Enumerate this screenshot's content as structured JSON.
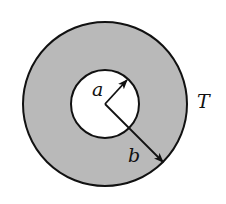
{
  "diagram": {
    "title": "",
    "colors": {
      "background": "#ffffff",
      "annulus_fill": "#b9b9b9",
      "inner_fill": "#ffffff",
      "stroke": "#111111"
    },
    "outer_circle": {
      "cx": 105,
      "cy": 104,
      "r": 82
    },
    "inner_circle": {
      "cx": 105,
      "cy": 104,
      "r": 34
    },
    "labels": {
      "inner_radius": "a",
      "outer_radius": "b",
      "temperature": "T"
    },
    "arrows": [
      {
        "name": "inner-radius-arrow",
        "label": "a",
        "from": [
          105,
          104
        ],
        "to": [
          127,
          80
        ]
      },
      {
        "name": "outer-radius-arrow",
        "label": "b",
        "from": [
          105,
          104
        ],
        "to": [
          163,
          162
        ]
      }
    ]
  }
}
